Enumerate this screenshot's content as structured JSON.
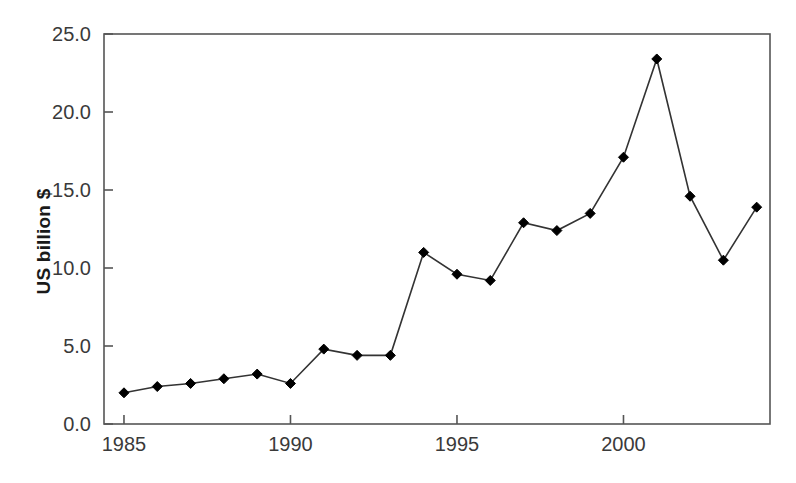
{
  "chart_data": {
    "type": "line",
    "title": "",
    "subtitle": "",
    "xlabel": "",
    "ylabel": "US billion $",
    "x": [
      1985,
      1986,
      1987,
      1988,
      1989,
      1990,
      1991,
      1992,
      1993,
      1994,
      1995,
      1996,
      1997,
      1998,
      1999,
      2000,
      2001,
      2002,
      2003,
      2004
    ],
    "values": [
      2.0,
      2.4,
      2.6,
      2.9,
      3.2,
      2.6,
      4.8,
      4.4,
      4.4,
      11.0,
      9.6,
      9.2,
      12.9,
      12.4,
      13.5,
      17.1,
      23.4,
      14.6,
      10.5,
      13.9
    ],
    "series": [
      {
        "name": "US billion $",
        "values": [
          2.0,
          2.4,
          2.6,
          2.9,
          3.2,
          2.6,
          4.8,
          4.4,
          4.4,
          11.0,
          9.6,
          9.2,
          12.9,
          12.4,
          13.5,
          17.1,
          23.4,
          14.6,
          10.5,
          13.9
        ]
      }
    ],
    "xlim": [
      1984.4,
      2004.4
    ],
    "ylim": [
      0.0,
      25.0
    ],
    "xticks": [
      1985,
      1990,
      1995,
      2000
    ],
    "xtick_labels": [
      "1985",
      "1990",
      "1995",
      "2000"
    ],
    "yticks": [
      0.0,
      5.0,
      10.0,
      15.0,
      20.0,
      25.0
    ],
    "ytick_labels": [
      "0.0",
      "5.0",
      "10.0",
      "15.0",
      "20.0",
      "25.0"
    ],
    "grid": false,
    "legend": false,
    "legend_position": "none",
    "marker": "diamond",
    "line_color": "#333333",
    "marker_color": "#000000",
    "axis_color": "#555555",
    "background_color": "#ffffff",
    "annotations": []
  },
  "axis": {
    "ylabel_text": "US billion $"
  }
}
